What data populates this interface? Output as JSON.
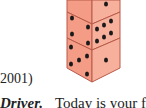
{
  "figure": {
    "name": "stacked-dice-illustration",
    "dice_count": 3,
    "face_color": "#f4a08a",
    "pip_color": "#1a1a1a",
    "edge_color": "#b85a48"
  },
  "citation_fragment": "2001)",
  "body_line": {
    "bold_term": "Driver.",
    "text": "Today is your first"
  }
}
